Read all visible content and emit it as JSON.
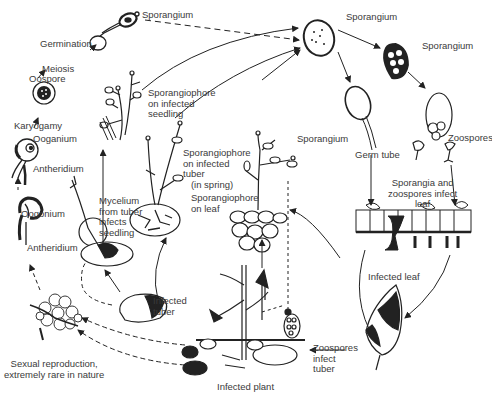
{
  "diagram": {
    "labels": {
      "sporangium_top_left": "Sporangium",
      "germination": "Germination",
      "meiosis": "Meiosis",
      "oospore": "Oospore",
      "karyogamy": "Karyogamy",
      "oganium": "Ooganium",
      "antheridium_upper": "Antheridium",
      "oogonium": "Oogonium",
      "antheridium_lower": "Antheridium",
      "sexual_reproduction": "Sexual reproduction,\nextremely rare in nature",
      "sporangiophore_seedling": "Sporangiophore\non infected\nseedling",
      "mycelium_tuber": "Mycelium\nfrom tuber\ninfects\nseedling",
      "sporangiophore_tuber": "Sporangiophore\non infected\ntuber\n   (in spring)",
      "infected_tuber": "Infected\ntuber",
      "sporangium_mid": "Sporangium",
      "sporangiophore_leaf": "Sporangiophore\non leaf",
      "infected_plant": "Infected plant",
      "zoospores_infect_tuber": "Zoospores\ninfect\ntuber",
      "sporangium_top_center": "Sporangium",
      "sporangium_top_right": "Sporangium",
      "germ_tube": "Germ tube",
      "zoospores": "Zoospores",
      "sporangia_zoospores_infect_leaf": "Sporangia and\nzoospores infect\nleaf",
      "infected_leaf": "Infected leaf"
    }
  }
}
